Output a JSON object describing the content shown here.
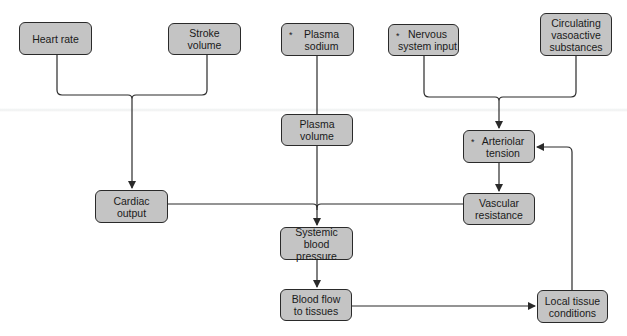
{
  "diagram": {
    "nodes": [
      {
        "id": "heart-rate",
        "label": "Heart rate",
        "starred": false
      },
      {
        "id": "stroke-volume",
        "label": "Stroke\nvolume",
        "starred": false
      },
      {
        "id": "plasma-sodium",
        "label": "Plasma\nsodium",
        "starred": true
      },
      {
        "id": "nervous-system-input",
        "label": "Nervous\nsystem input",
        "starred": true
      },
      {
        "id": "circulating-vasoactive-substances",
        "label": "Circulating\nvasoactive\nsubstances",
        "starred": false
      },
      {
        "id": "plasma-volume",
        "label": "Plasma\nvolume",
        "starred": false
      },
      {
        "id": "arteriolar-tension",
        "label": "Arteriolar\ntension",
        "starred": true
      },
      {
        "id": "cardiac-output",
        "label": "Cardiac\noutput",
        "starred": false
      },
      {
        "id": "vascular-resistance",
        "label": "Vascular\nresistance",
        "starred": false
      },
      {
        "id": "systemic-blood-pressure",
        "label": "Systemic blood\npressure",
        "starred": false
      },
      {
        "id": "blood-flow-to-tissues",
        "label": "Blood flow\nto tissues",
        "starred": false
      },
      {
        "id": "local-tissue-conditions",
        "label": "Local tissue\nconditions",
        "starred": false
      }
    ],
    "star_symbol": "*",
    "edges": [
      [
        "heart-rate",
        "cardiac-output"
      ],
      [
        "stroke-volume",
        "cardiac-output"
      ],
      [
        "plasma-sodium",
        "plasma-volume"
      ],
      [
        "nervous-system-input",
        "arteriolar-tension"
      ],
      [
        "circulating-vasoactive-substances",
        "arteriolar-tension"
      ],
      [
        "arteriolar-tension",
        "vascular-resistance"
      ],
      [
        "cardiac-output",
        "systemic-blood-pressure"
      ],
      [
        "plasma-volume",
        "systemic-blood-pressure"
      ],
      [
        "vascular-resistance",
        "systemic-blood-pressure"
      ],
      [
        "systemic-blood-pressure",
        "blood-flow-to-tissues"
      ],
      [
        "blood-flow-to-tissues",
        "local-tissue-conditions"
      ],
      [
        "local-tissue-conditions",
        "arteriolar-tension"
      ]
    ],
    "colors": {
      "node_fill": "#c4c4c4",
      "stroke": "#2a2a2a"
    }
  }
}
